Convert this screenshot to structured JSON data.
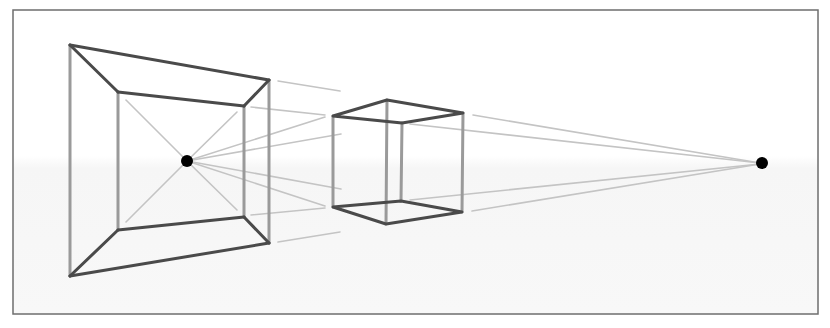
{
  "diagram": {
    "title": "",
    "colors": {
      "background": "#ffffff",
      "background_lower": "#f7f7f7",
      "frame_border": "#6e6e6e",
      "dark_edges": "#4a4a4a",
      "light_edges": "#9a9a9a",
      "guide_lines": "#c4c4c4",
      "vanishing_points": "#000000"
    },
    "vanishing_points": [
      {
        "name": "left-vanishing-point",
        "x": 187,
        "y": 161
      },
      {
        "name": "right-vanishing-point",
        "x": 762,
        "y": 163
      }
    ],
    "frame_shape": {
      "outer": [
        [
          70,
          45
        ],
        [
          269,
          80
        ],
        [
          269,
          243
        ],
        [
          70,
          276
        ]
      ],
      "inner": [
        [
          118,
          92
        ],
        [
          244,
          106
        ],
        [
          244,
          217
        ],
        [
          118,
          230
        ]
      ]
    },
    "cube": {
      "top": [
        [
          333,
          116
        ],
        [
          387,
          100
        ],
        [
          463,
          113
        ],
        [
          402,
          123
        ]
      ],
      "bottom": [
        [
          333,
          207
        ],
        [
          386,
          224
        ],
        [
          462,
          212
        ],
        [
          401,
          201
        ]
      ]
    }
  }
}
